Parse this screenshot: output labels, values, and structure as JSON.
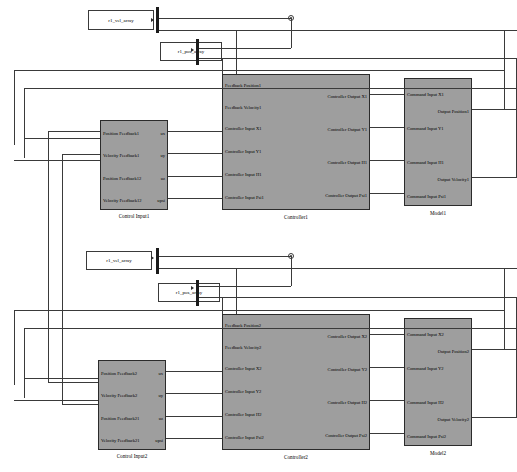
{
  "diagram": {
    "accent_block_fill": "#9e9e9e",
    "wire_color": "#3a3a3a"
  },
  "sources": [
    {
      "name": "r1_vel_array_top",
      "label": "r1_vel_array"
    },
    {
      "name": "r1_pos_array_top",
      "label": "r1_pos_array"
    },
    {
      "name": "r1_vel_array_bottom",
      "label": "r1_vel_array"
    },
    {
      "name": "r1_pos_array_bottom",
      "label": "r1_pos_array"
    }
  ],
  "blocks": {
    "control_input1": {
      "title": "Control Input1",
      "inputs": [
        "Position Feedback1",
        "Velocity Feedback1",
        "Position Feedback12",
        "Velocity Feedback12"
      ],
      "outputs": [
        "ux",
        "uy",
        "uz",
        "upsi"
      ]
    },
    "controller1": {
      "title": "Controller1",
      "inputs": [
        "Feedback Position1",
        "Feedback Velocity1",
        "Controller Input X1",
        "Controller Input Y1",
        "Controller Input H1",
        "Controller Input Psi1"
      ],
      "outputs": [
        "Controller Output X1",
        "Controller Output Y1",
        "Controller Output H1",
        "Controller Output Psi1"
      ]
    },
    "model1": {
      "title": "Model1",
      "inputs": [
        "Command Input X1",
        "Command Input Y1",
        "Command Input H1",
        "Command Input Psi1"
      ],
      "outputs": [
        "Output Position1",
        "Output Velocity1"
      ]
    },
    "control_input2": {
      "title": "Control Input2",
      "inputs": [
        "Position Feedback2",
        "Velocity Feedback2",
        "Position Feedback21",
        "Velocity Feedback21"
      ],
      "outputs": [
        "ux",
        "uy",
        "uz",
        "upsi"
      ]
    },
    "controller2": {
      "title": "Controller2",
      "inputs": [
        "Feedback Position2",
        "Feedback Velocity2",
        "Controller Input X2",
        "Controller Input Y2",
        "Controller Input H2",
        "Controller Input Psi2"
      ],
      "outputs": [
        "Controller Output X2",
        "Controller Output Y2",
        "Controller Output H2",
        "Controller Output Psi2"
      ]
    },
    "model2": {
      "title": "Model2",
      "inputs": [
        "Command Input X2",
        "Command Input Y2",
        "Command Input H2",
        "Command Input Psi2"
      ],
      "outputs": [
        "Output Position2",
        "Output Velocity2"
      ]
    }
  }
}
